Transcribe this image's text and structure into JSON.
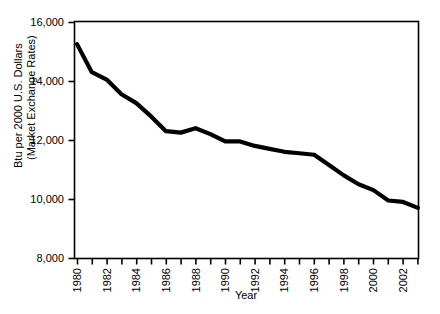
{
  "chart_data": {
    "type": "line",
    "title": "",
    "xlabel": "Year",
    "ylabel": "Btu per 2000 U.S. Dollars",
    "ylabel_line2": "(Market Exchange Rates)",
    "ylim": [
      8000,
      16000
    ],
    "xlim": [
      1980,
      2003
    ],
    "grid": false,
    "legend": "none",
    "series_color": "#000000",
    "background": "#ffffff",
    "ytick_labels": [
      "8,000",
      "10,000",
      "12,000",
      "14,000",
      "16,000"
    ],
    "ytick_values": [
      8000,
      10000,
      12000,
      14000,
      16000
    ],
    "xtick_labels": [
      "1980",
      "1982",
      "1984",
      "1986",
      "1988",
      "1990",
      "1992",
      "1994",
      "1996",
      "1998",
      "2000",
      "2002"
    ],
    "xtick_values": [
      1980,
      1982,
      1984,
      1986,
      1988,
      1990,
      1992,
      1994,
      1996,
      1998,
      2000,
      2002
    ],
    "x": [
      1980,
      1981,
      1982,
      1983,
      1984,
      1985,
      1986,
      1987,
      1988,
      1989,
      1990,
      1991,
      1992,
      1993,
      1994,
      1995,
      1996,
      1997,
      1998,
      1999,
      2000,
      2001,
      2002,
      2003
    ],
    "categories": [
      1980,
      1981,
      1982,
      1983,
      1984,
      1985,
      1986,
      1987,
      1988,
      1989,
      1990,
      1991,
      1992,
      1993,
      1994,
      1995,
      1996,
      1997,
      1998,
      1999,
      2000,
      2001,
      2002,
      2003
    ],
    "values": [
      15250,
      14300,
      14050,
      13550,
      13250,
      12800,
      12300,
      12250,
      12400,
      12200,
      11950,
      11950,
      11800,
      11700,
      11600,
      11550,
      11500,
      11150,
      10800,
      10500,
      10300,
      9950,
      9900,
      9700
    ],
    "series": [
      {
        "name": "Energy intensity",
        "values": [
          15250,
          14300,
          14050,
          13550,
          13250,
          12800,
          12300,
          12250,
          12400,
          12200,
          11950,
          11950,
          11800,
          11700,
          11600,
          11550,
          11500,
          11150,
          10800,
          10500,
          10300,
          9950,
          9900,
          9700
        ]
      }
    ]
  }
}
